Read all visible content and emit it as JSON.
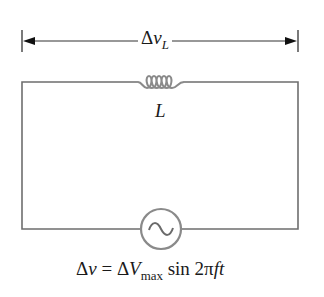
{
  "diagram": {
    "type": "circuit",
    "voltage_arrow": {
      "symbol": "Δ",
      "var": "v",
      "sub": "L"
    },
    "inductor": {
      "label": "L"
    },
    "source": {
      "symbol": "~",
      "equation": {
        "lhs_delta": "Δ",
        "lhs_var": "v",
        "equals": " = ",
        "rhs_delta": "Δ",
        "rhs_var": "V",
        "rhs_sub": "max",
        "func": " sin 2π",
        "arg": "ft"
      }
    },
    "colors": {
      "wire": "#6b6b6b",
      "component": "#8a8a8a",
      "arrow": "#222222",
      "text": "#1a1a1a"
    }
  }
}
